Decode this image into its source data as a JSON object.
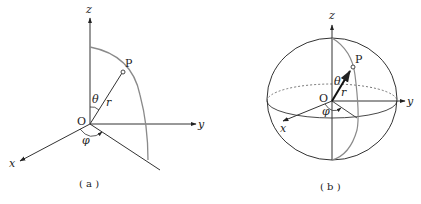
{
  "figures": [
    {
      "id": "a",
      "caption": "( a )",
      "labels": {
        "z": "z",
        "y": "y",
        "x": "x",
        "origin": "O",
        "point": "P",
        "theta": "θ",
        "radius": "r",
        "phi": "φ"
      },
      "description": "Spherical coordinate system axes with point P on a quarter meridian arc"
    },
    {
      "id": "b",
      "caption": "( b )",
      "labels": {
        "z": "z",
        "y": "y",
        "x": "x",
        "origin": "O",
        "point": "P",
        "theta": "θ",
        "radius": "r",
        "phi": "φ"
      },
      "description": "Sphere with equator, meridian through P, and radius vector r"
    }
  ],
  "colors": {
    "axis": "#222222",
    "arc": "#8a8a8a"
  }
}
